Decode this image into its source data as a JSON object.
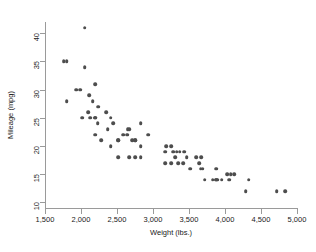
{
  "chart": {
    "type": "scatter",
    "title": "",
    "xlabel": "Weight (lbs.)",
    "ylabel": "Mileage (mpg)",
    "xticklabels": [
      "1,500",
      "2,000",
      "2,500",
      "3,000",
      "3,500",
      "4,000",
      "4,500",
      "5,000"
    ],
    "yticklabels": [
      "10",
      "15",
      "20",
      "25",
      "30",
      "35",
      "40"
    ],
    "marker_color": "#4d4d4d",
    "axis_color": "#9a9a9a",
    "background": "#ffffff"
  },
  "chart_data": {
    "type": "scatter",
    "title": "",
    "xlabel": "Weight (lbs.)",
    "ylabel": "Mileage (mpg)",
    "xlim": [
      1500,
      5000
    ],
    "ylim": [
      9,
      42
    ],
    "xticks": [
      1500,
      2000,
      2500,
      3000,
      3500,
      4000,
      4500,
      5000
    ],
    "yticks": [
      10,
      15,
      20,
      25,
      30,
      35,
      40
    ],
    "xticklabels": [
      "1,500",
      "2,000",
      "2,500",
      "3,000",
      "3,500",
      "4,000",
      "4,500",
      "5,000"
    ],
    "yticklabels": [
      "10",
      "15",
      "20",
      "25",
      "30",
      "35",
      "40"
    ],
    "grid": false,
    "legend": false,
    "series": [
      {
        "name": "Automobiles",
        "marker": "circle",
        "color": "#4d4d4d",
        "x": [
          2930,
          3350,
          2640,
          3250,
          4080,
          3670,
          3880,
          4330,
          3900,
          4290,
          3520,
          3330,
          3185,
          3660,
          3880,
          4130,
          4060,
          3720,
          3955,
          3830,
          2585,
          2370,
          2020,
          2280,
          3430,
          3600,
          2050,
          2410,
          2200,
          2520,
          2520,
          2830,
          3250,
          4030,
          3640,
          4720,
          3420,
          3310,
          3690,
          3370,
          2200,
          2520,
          2130,
          2650,
          2750,
          3470,
          2830,
          2100,
          2160,
          1800,
          2670,
          2230,
          2750,
          3170,
          2710,
          2350,
          2450,
          3280,
          3880,
          4840,
          2110,
          2200,
          2670,
          1760,
          2750,
          1800,
          2050,
          2410,
          2200,
          1930,
          1990,
          3170,
          2830,
          2240
        ],
        "y": [
          22,
          17,
          22,
          20,
          15,
          18,
          14,
          14,
          14,
          12,
          16,
          19,
          20,
          16,
          14,
          15,
          14,
          14,
          14,
          14,
          22,
          23,
          25,
          21,
          19,
          18,
          34,
          20,
          22,
          21,
          18,
          18,
          17,
          15,
          17,
          12,
          17,
          18,
          16,
          19,
          25,
          21,
          25,
          23,
          21,
          18,
          24,
          26,
          28,
          28,
          23,
          24,
          21,
          19,
          21,
          26,
          24,
          19,
          16,
          12,
          29,
          31,
          18,
          35,
          18,
          35,
          41,
          25,
          25,
          30,
          30,
          17,
          20,
          27
        ],
        "n": 74
      }
    ]
  }
}
